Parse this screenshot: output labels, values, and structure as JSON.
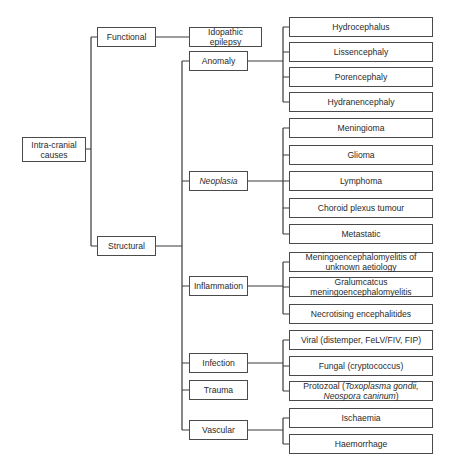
{
  "diagram": {
    "root": {
      "label": "Intra-cranial causes"
    },
    "level1": [
      {
        "id": "functional",
        "label": "Functional"
      },
      {
        "id": "structural",
        "label": "Structural"
      }
    ],
    "functional_children": [
      {
        "id": "idiopathic",
        "label": "Idopathic epilepsy"
      }
    ],
    "structural_children": [
      {
        "id": "anomaly",
        "label": "Anomaly"
      },
      {
        "id": "neoplasia",
        "label": "Neoplasia",
        "italic": true
      },
      {
        "id": "inflammation",
        "label": "Inflammation"
      },
      {
        "id": "infection",
        "label": "Infection"
      },
      {
        "id": "trauma",
        "label": "Trauma"
      },
      {
        "id": "vascular",
        "label": "Vascular"
      }
    ],
    "leaves": {
      "anomaly": [
        "Hydrocephalus",
        "Lissencephaly",
        "Porencephaly",
        "Hydranencephaly"
      ],
      "neoplasia": [
        "Meningioma",
        "Glioma",
        "Lymphoma",
        "Choroid plexus tumour",
        "Metastatic"
      ],
      "inflammation": [
        "Meningoencephalomyelitis of unknown aetiology",
        "Gralumcatcus meningoencephalomyelitis",
        "Necrotising encephalitides"
      ],
      "infection": [
        "Viral (distemper, FeLV/FIV, FIP)",
        "Fungal (cryptococcus)",
        {
          "prefix": "Protozoal (",
          "italic": "Toxoplasma gondii, Neospora caninum",
          "suffix": ")"
        }
      ],
      "vascular": [
        "Ischaemia",
        "Haemorrhage"
      ]
    },
    "colors": {
      "line": "#3a3a3a",
      "border": "#4a4a4a",
      "background": "#ffffff",
      "text": "#2a2a2a"
    }
  }
}
